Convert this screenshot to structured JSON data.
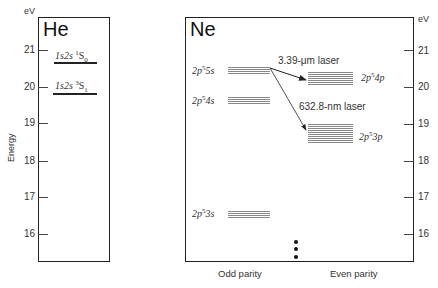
{
  "he_panel": {
    "title": "He",
    "unit": "eV",
    "axis_title": "Energy",
    "ticks": [
      "21",
      "20",
      "19",
      "18",
      "17",
      "16"
    ],
    "levels": [
      {
        "config": "1s2s",
        "term_sup": "1",
        "term": "S",
        "term_sub": "0",
        "energy_eV": 20.61
      },
      {
        "config": "1s2s",
        "term_sup": "3",
        "term": "S",
        "term_sub": "1",
        "energy_eV": 19.82
      }
    ]
  },
  "ne_panel": {
    "title": "Ne",
    "unit": "eV",
    "ticks": [
      "21",
      "20",
      "19",
      "18",
      "17",
      "16"
    ],
    "odd_levels": [
      {
        "label_pre": "2p",
        "label_sup": "5",
        "label_post": "5s",
        "energy_eV": 20.66
      },
      {
        "label_pre": "2p",
        "label_sup": "5",
        "label_post": "4s",
        "energy_eV": 19.78
      },
      {
        "label_pre": "2p",
        "label_sup": "5",
        "label_post": "3s",
        "energy_eV": 16.7
      }
    ],
    "even_levels": [
      {
        "label_pre": "2p",
        "label_sup": "5",
        "label_post": "4p",
        "energy_eV": 20.3
      },
      {
        "label_pre": "2p",
        "label_sup": "5",
        "label_post": "3p",
        "energy_eV": 18.7
      }
    ],
    "transitions": [
      {
        "label": "3.39-μm laser",
        "from": "2p55s",
        "to": "2p54p"
      },
      {
        "label": "632.8-nm laser",
        "from": "2p55s",
        "to": "2p53p"
      }
    ],
    "x_labels": {
      "odd": "Odd parity",
      "even": "Even parity"
    },
    "continuation": "⋮"
  }
}
